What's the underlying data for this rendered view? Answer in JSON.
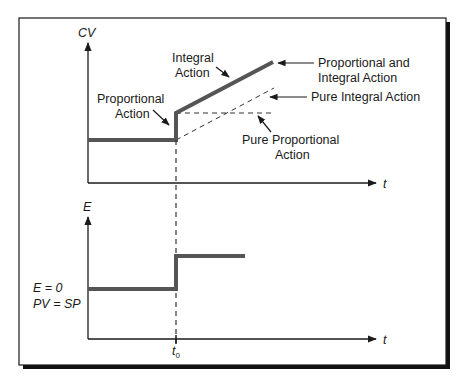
{
  "diagram": {
    "top_plot": {
      "y_axis_label": "CV",
      "x_axis_label": "t",
      "annotations": {
        "integral_action": [
          "Integral",
          "Action"
        ],
        "proportional_action": [
          "Proportional",
          "Action"
        ],
        "pi_action": [
          "Proportional and",
          "Integral Action"
        ],
        "pure_integral": "Pure Integral Action",
        "pure_proportional": [
          "Pure Proportional",
          "Action"
        ]
      }
    },
    "bottom_plot": {
      "y_axis_label": "E",
      "x_axis_label": "t",
      "baseline_labels": [
        "E = 0",
        "PV = SP"
      ],
      "step_time_label": "t",
      "step_time_subscript": "0"
    },
    "colors": {
      "signal": "#555555",
      "axis": "#1a1a1a",
      "dashed": "#333333",
      "frame_shadow": "#111111"
    }
  }
}
